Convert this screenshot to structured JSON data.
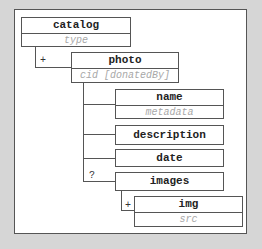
{
  "diagram": {
    "nodes": {
      "catalog": {
        "name": "catalog",
        "attr": "type"
      },
      "photo": {
        "name": "photo",
        "attr": "cid [donatedBy]"
      },
      "name": {
        "name": "name",
        "attr": "metadata"
      },
      "description": {
        "name": "description"
      },
      "date": {
        "name": "date"
      },
      "images": {
        "name": "images"
      },
      "img": {
        "name": "img",
        "attr": "src"
      }
    },
    "cardinalities": {
      "catalog_photo": "+",
      "photo_images": "?",
      "images_img": "+"
    },
    "colors": {
      "background": "#d6d6d6",
      "frame": "#ffffff",
      "border": "#555555",
      "attribute_text": "#a8a8a8"
    }
  }
}
